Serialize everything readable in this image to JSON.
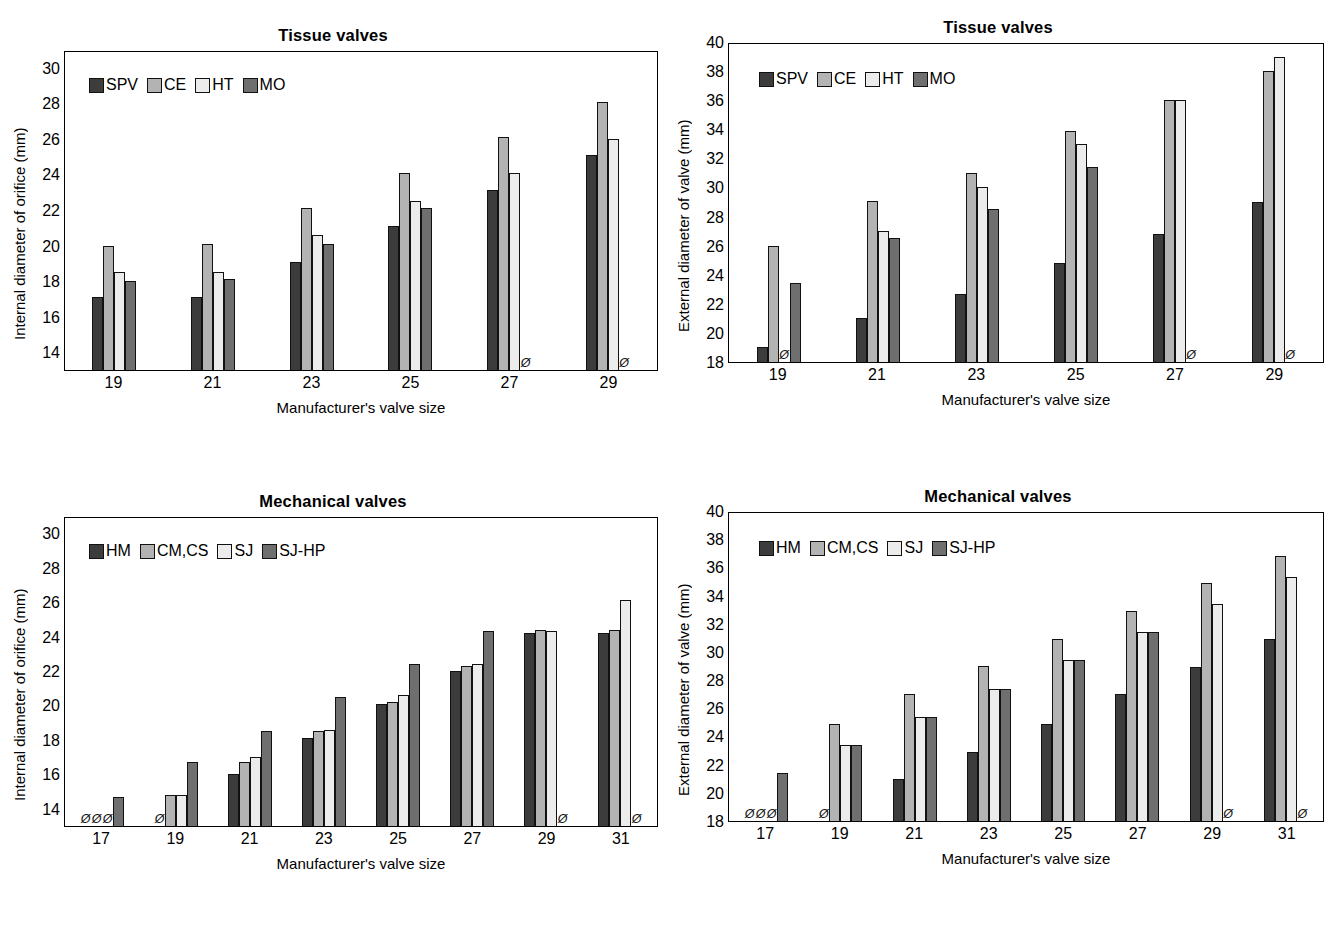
{
  "figure": {
    "background": "#ffffff",
    "series_colors": {
      "dark": "#3c3c3c",
      "medium_light": "#b3b3b3",
      "light": "#ececec",
      "medium_dark": "#6f6f6f"
    },
    "null_marker": "Ø",
    "null_marker_meaning": "not available"
  },
  "panels": [
    {
      "id": "top-left",
      "title": "Tissue valves",
      "chart_data": {
        "type": "bar",
        "title": "Tissue valves",
        "xlabel": "Manufacturer's valve size",
        "ylabel": "Internal diameter of orifice (mm)",
        "categories": [
          "19",
          "21",
          "23",
          "25",
          "27",
          "29"
        ],
        "ylim": [
          13,
          31
        ],
        "yticks": [
          14,
          16,
          18,
          20,
          22,
          24,
          26,
          28,
          30
        ],
        "ytick_labels": [
          "14",
          "16",
          "18",
          "20",
          "22",
          "24",
          "26",
          "28",
          "30"
        ],
        "grid": false,
        "legend_position": "top-left inside",
        "series": [
          {
            "name": "SPV",
            "color": "#3c3c3c",
            "values": [
              17.1,
              17.1,
              19.1,
              21.1,
              23.1,
              25.1
            ]
          },
          {
            "name": "CE",
            "color": "#b3b3b3",
            "values": [
              20.0,
              20.1,
              22.1,
              24.1,
              26.1,
              28.1
            ]
          },
          {
            "name": "HT",
            "color": "#ececec",
            "values": [
              18.5,
              18.5,
              20.6,
              22.5,
              24.1,
              26.0
            ]
          },
          {
            "name": "MO",
            "color": "#6f6f6f",
            "values": [
              18.0,
              18.1,
              20.1,
              22.1,
              null,
              null
            ]
          }
        ]
      }
    },
    {
      "id": "top-right",
      "title": "Tissue valves",
      "chart_data": {
        "type": "bar",
        "title": "Tissue valves",
        "xlabel": "Manufacturer's valve size",
        "ylabel": "External diameter of valve (mm)",
        "categories": [
          "19",
          "21",
          "23",
          "25",
          "27",
          "29"
        ],
        "ylim": [
          18,
          40
        ],
        "yticks": [
          18,
          20,
          22,
          24,
          26,
          28,
          30,
          32,
          34,
          36,
          38,
          40
        ],
        "ytick_labels": [
          "18",
          "20",
          "22",
          "24",
          "26",
          "28",
          "30",
          "32",
          "34",
          "36",
          "38",
          "40"
        ],
        "grid": false,
        "legend_position": "top-left inside",
        "series": [
          {
            "name": "SPV",
            "color": "#3c3c3c",
            "values": [
              19.0,
              21.0,
              22.7,
              24.8,
              26.8,
              29.0
            ]
          },
          {
            "name": "CE",
            "color": "#b3b3b3",
            "values": [
              26.0,
              29.1,
              31.0,
              33.9,
              36.0,
              38.0
            ]
          },
          {
            "name": "HT",
            "color": "#ececec",
            "values": [
              null,
              27.0,
              30.0,
              33.0,
              36.0,
              39.0
            ]
          },
          {
            "name": "MO",
            "color": "#6f6f6f",
            "values": [
              23.4,
              26.5,
              28.5,
              31.4,
              null,
              null
            ]
          }
        ]
      }
    },
    {
      "id": "bottom-left",
      "title": "Mechanical valves",
      "chart_data": {
        "type": "bar",
        "title": "Mechanical valves",
        "xlabel": "Manufacturer's valve size",
        "ylabel": "Internal diameter of orifice (mm)",
        "categories": [
          "17",
          "19",
          "21",
          "23",
          "25",
          "27",
          "29",
          "31"
        ],
        "ylim": [
          13,
          31
        ],
        "yticks": [
          14,
          16,
          18,
          20,
          22,
          24,
          26,
          28,
          30
        ],
        "ytick_labels": [
          "14",
          "16",
          "18",
          "20",
          "22",
          "24",
          "26",
          "28",
          "30"
        ],
        "grid": false,
        "legend_position": "top-left inside",
        "series": [
          {
            "name": "HM",
            "color": "#3c3c3c",
            "values": [
              null,
              null,
              16.0,
              18.1,
              20.1,
              22.0,
              24.2,
              24.2
            ]
          },
          {
            "name": "CM,CS",
            "color": "#b3b3b3",
            "values": [
              null,
              14.8,
              16.7,
              18.5,
              20.2,
              22.3,
              24.4,
              24.4
            ]
          },
          {
            "name": "SJ",
            "color": "#ececec",
            "values": [
              null,
              14.8,
              17.0,
              18.6,
              20.6,
              22.4,
              24.3,
              26.1
            ]
          },
          {
            "name": "SJ-HP",
            "color": "#6f6f6f",
            "values": [
              14.7,
              16.7,
              18.5,
              20.5,
              22.4,
              24.3,
              null,
              null
            ]
          }
        ]
      }
    },
    {
      "id": "bottom-right",
      "title": "Mechanical valves",
      "chart_data": {
        "type": "bar",
        "title": "Mechanical valves",
        "xlabel": "Manufacturer's valve size",
        "ylabel": "External diameter of valve (mm)",
        "categories": [
          "17",
          "19",
          "21",
          "23",
          "25",
          "27",
          "29",
          "31"
        ],
        "ylim": [
          18,
          40
        ],
        "yticks": [
          18,
          20,
          22,
          24,
          26,
          28,
          30,
          32,
          34,
          36,
          38,
          40
        ],
        "ytick_labels": [
          "18",
          "20",
          "22",
          "24",
          "26",
          "28",
          "30",
          "32",
          "34",
          "36",
          "38",
          "40"
        ],
        "grid": false,
        "legend_position": "top-left inside",
        "series": [
          {
            "name": "HM",
            "color": "#3c3c3c",
            "values": [
              null,
              null,
              21.0,
              22.9,
              24.9,
              27.0,
              28.9,
              30.9
            ]
          },
          {
            "name": "CM,CS",
            "color": "#b3b3b3",
            "values": [
              null,
              24.9,
              27.0,
              29.0,
              30.9,
              32.9,
              34.9,
              36.8
            ]
          },
          {
            "name": "SJ",
            "color": "#ececec",
            "values": [
              null,
              23.4,
              25.4,
              27.4,
              29.4,
              31.4,
              33.4,
              35.3
            ]
          },
          {
            "name": "SJ-HP",
            "color": "#6f6f6f",
            "values": [
              21.4,
              23.4,
              25.4,
              27.4,
              29.4,
              31.4,
              null,
              null
            ]
          }
        ]
      }
    }
  ]
}
